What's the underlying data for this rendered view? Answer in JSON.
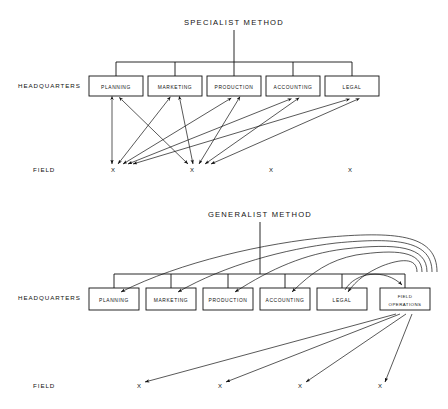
{
  "page": {
    "background_color": "#ffffff",
    "ink_color": "#111111",
    "width": 448,
    "height": 409
  },
  "diagrams": [
    {
      "id": "specialist",
      "title": "SPECIALIST  METHOD",
      "row_labels": {
        "headquarters": "HEADQUARTERS",
        "field": "FIELD"
      },
      "boxes": [
        {
          "label": "PLANNING",
          "x": 89,
          "y": 76,
          "w": 54,
          "h": 20
        },
        {
          "label": "MARKETING",
          "x": 148,
          "y": 76,
          "w": 54,
          "h": 20
        },
        {
          "label": "PRODUCTION",
          "x": 207,
          "y": 76,
          "w": 54,
          "h": 20
        },
        {
          "label": "ACCOUNTING",
          "x": 266,
          "y": 76,
          "w": 54,
          "h": 20
        },
        {
          "label": "LEGAL",
          "x": 325,
          "y": 76,
          "w": 54,
          "h": 20
        }
      ],
      "field_nodes": [
        {
          "label": "X",
          "x": 113,
          "y": 170
        },
        {
          "label": "X",
          "x": 192,
          "y": 170
        },
        {
          "label": "X",
          "x": 271,
          "y": 170
        },
        {
          "label": "X",
          "x": 350,
          "y": 170
        }
      ],
      "bus": {
        "y": 62,
        "x1": 116,
        "x2": 352,
        "stem_x": 234,
        "stem_top": 30
      },
      "connections": [
        {
          "from_box": 0,
          "to_field": 0,
          "arrows": "both"
        },
        {
          "from_box": 0,
          "to_field": 1,
          "arrows": "both"
        },
        {
          "from_box": 1,
          "to_field": 0,
          "arrows": "both"
        },
        {
          "from_box": 1,
          "to_field": 1,
          "arrows": "both"
        },
        {
          "from_box": 2,
          "to_field": 0,
          "arrows": "both"
        },
        {
          "from_box": 2,
          "to_field": 1,
          "arrows": "both"
        },
        {
          "from_box": 3,
          "to_field": 0,
          "arrows": "both"
        },
        {
          "from_box": 3,
          "to_field": 1,
          "arrows": "both"
        },
        {
          "from_box": 4,
          "to_field": 0,
          "arrows": "both"
        },
        {
          "from_box": 4,
          "to_field": 1,
          "arrows": "both"
        }
      ],
      "note": "Each headquarters department communicates directly with field locations; many crossing double-headed arrows converge on the first two field nodes."
    },
    {
      "id": "generalist",
      "title": "GENERALIST  METHOD",
      "row_labels": {
        "headquarters": "HEADQUARTERS",
        "field": "FIELD"
      },
      "boxes": [
        {
          "label": "PLANNING",
          "x": 89,
          "y": 288,
          "w": 50,
          "h": 22
        },
        {
          "label": "MARKETING",
          "x": 146,
          "y": 288,
          "w": 50,
          "h": 22
        },
        {
          "label": "PRODUCTION",
          "x": 203,
          "y": 288,
          "w": 50,
          "h": 22
        },
        {
          "label": "ACCOUNTING",
          "x": 260,
          "y": 288,
          "w": 50,
          "h": 22
        },
        {
          "label": "LEGAL",
          "x": 317,
          "y": 288,
          "w": 50,
          "h": 22
        },
        {
          "label": "FIELD OPERATIONS",
          "line1": "FIELD",
          "line2": "OPERATIONS",
          "x": 380,
          "y": 288,
          "w": 50,
          "h": 22
        }
      ],
      "field_nodes": [
        {
          "label": "X",
          "x": 139,
          "y": 386
        },
        {
          "label": "X",
          "x": 220,
          "y": 386
        },
        {
          "label": "X",
          "x": 300,
          "y": 386
        },
        {
          "label": "X",
          "x": 380,
          "y": 386
        }
      ],
      "bus": {
        "y": 274,
        "x1": 114,
        "x2": 405,
        "stem_x": 260,
        "stem_top": 222
      },
      "hub_box_index": 5,
      "note": "All field contact routes through a single FIELD OPERATIONS unit, which then curves back to each headquarters department."
    }
  ]
}
